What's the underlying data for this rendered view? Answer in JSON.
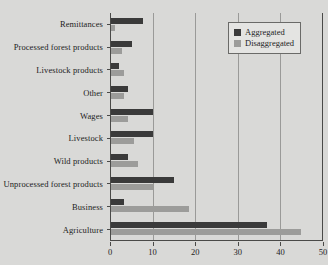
{
  "chart_data": {
    "type": "bar",
    "orientation": "horizontal",
    "title": "",
    "xlabel": "",
    "ylabel": "",
    "xlim": [
      0,
      50
    ],
    "xticks": [
      0,
      10,
      20,
      30,
      40,
      50
    ],
    "grid": true,
    "legend_position": "top-right",
    "categories": [
      "Remittances",
      "Processed forest products",
      "Livestock products",
      "Other",
      "Wages",
      "Livestock",
      "Wild products",
      "Unprocessed forest products",
      "Business",
      "Agriculture"
    ],
    "series": [
      {
        "name": "Aggregated",
        "color": "#3a3a3a",
        "values": [
          7.5,
          5.0,
          2.0,
          4.0,
          10.0,
          10.0,
          4.0,
          15.0,
          3.0,
          37.0
        ]
      },
      {
        "name": "Disaggregated",
        "color": "#9c9c9a",
        "values": [
          1.0,
          2.5,
          3.0,
          3.0,
          4.0,
          5.5,
          6.5,
          10.0,
          18.5,
          45.0
        ]
      }
    ]
  },
  "legend": {
    "items": [
      {
        "label": "Aggregated",
        "color": "#3a3a3a"
      },
      {
        "label": "Disaggregated",
        "color": "#9c9c9a"
      }
    ]
  },
  "axis": {
    "tick_labels": [
      "0",
      "10",
      "20",
      "30",
      "40",
      "50"
    ]
  }
}
